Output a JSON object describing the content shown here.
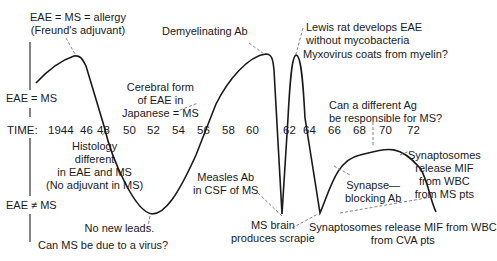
{
  "diagram": {
    "type": "historical-trend-curve",
    "axis_labels": {
      "equal": "EAE = MS",
      "not_equal": "EAE ≠ MS"
    },
    "timeline": {
      "prefix": "TIME:",
      "ticks": [
        "1944",
        "46",
        "48",
        "50",
        "52",
        "54",
        "56",
        "58",
        "60",
        "62",
        "64",
        "66",
        "68",
        "70",
        "72"
      ]
    },
    "annotations": {
      "allergy": {
        "line1": "EAE = MS = allergy",
        "line2": "(Freund's adjuvant)"
      },
      "histology": {
        "line1": "Histology",
        "line2": "different",
        "line3": "in EAE and MS",
        "line4": "(No adjuvant in MS)"
      },
      "no_leads": {
        "line1": "No new leads.",
        "line2": "Can MS be due to a virus?"
      },
      "cerebral": {
        "line1": "Cerebral form",
        "line2": "of EAE in",
        "line3": "Japanese = MS"
      },
      "demyelinating": {
        "line1": "Demyelinating Ab"
      },
      "measles": {
        "line1": "Measles Ab",
        "line2": "in CSF of MS"
      },
      "scrapie": {
        "line1": "MS brain",
        "line2": "produces scrapie"
      },
      "lewis": {
        "line1": "Lewis rat develops EAE",
        "line2": "without mycobacteria"
      },
      "myxovirus": {
        "line1": "Myxovirus coats from myelin?"
      },
      "different_ag": {
        "line1": "Can a different Ag",
        "line2": "be responsible for MS?"
      },
      "synapse_blocking": {
        "line1": "Synapse—",
        "line2": "blocking Ab"
      },
      "mif_ms": {
        "line1": "Synaptosomes",
        "line2": "release MIF",
        "line3": "from WBC",
        "line4": "from MS pts"
      },
      "mif_cva": {
        "line1": "Synaptosomes release MIF from WBC",
        "line2": "from CVA pts"
      }
    },
    "colors": {
      "curve": "#1a1a1a",
      "axis": "#333333",
      "leader": "#777777"
    }
  }
}
